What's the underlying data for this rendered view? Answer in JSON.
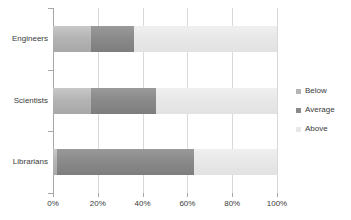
{
  "chart_data": {
    "type": "bar",
    "orientation": "horizontal",
    "stacked": true,
    "title": "",
    "xlabel": "",
    "ylabel": "",
    "categories": [
      "Engineers",
      "Scientists",
      "Librarians"
    ],
    "series": [
      {
        "name": "Below",
        "values": [
          17,
          17,
          2
        ],
        "color": "#b4b4b4"
      },
      {
        "name": "Average",
        "values": [
          19,
          29,
          61
        ],
        "color": "#8a8a8a"
      },
      {
        "name": "Above",
        "values": [
          64,
          54,
          37
        ],
        "color": "#e8e8e8"
      }
    ],
    "cumulative_boundaries": [
      {
        "category": "Engineers",
        "below_end": 17,
        "average_end": 36,
        "above_end": 100
      },
      {
        "category": "Scientists",
        "below_end": 17,
        "average_end": 46,
        "above_end": 100
      },
      {
        "category": "Librarians",
        "below_end": 2,
        "average_end": 63,
        "above_end": 100
      }
    ],
    "xlim": [
      0,
      100
    ],
    "xticks": [
      0,
      20,
      40,
      60,
      80,
      100
    ],
    "xtick_labels": [
      "0%",
      "20%",
      "40%",
      "60%",
      "80%",
      "100%"
    ],
    "grid": true,
    "grid_axis": "x",
    "legend_position": "right"
  },
  "axis": {
    "tick_labels": [
      "0%",
      "20%",
      "40%",
      "60%",
      "80%",
      "100%"
    ],
    "axis_color": "#a6a6a6",
    "grid_color": "#d9d9d9"
  },
  "categories": [
    {
      "label": "Engineers"
    },
    {
      "label": "Scientists"
    },
    {
      "label": "Librarians"
    }
  ],
  "legend": {
    "items": [
      {
        "label": "Below",
        "color": "#b4b4b4"
      },
      {
        "label": "Average",
        "color": "#8a8a8a"
      },
      {
        "label": "Above",
        "color": "#e8e8e8"
      }
    ]
  }
}
